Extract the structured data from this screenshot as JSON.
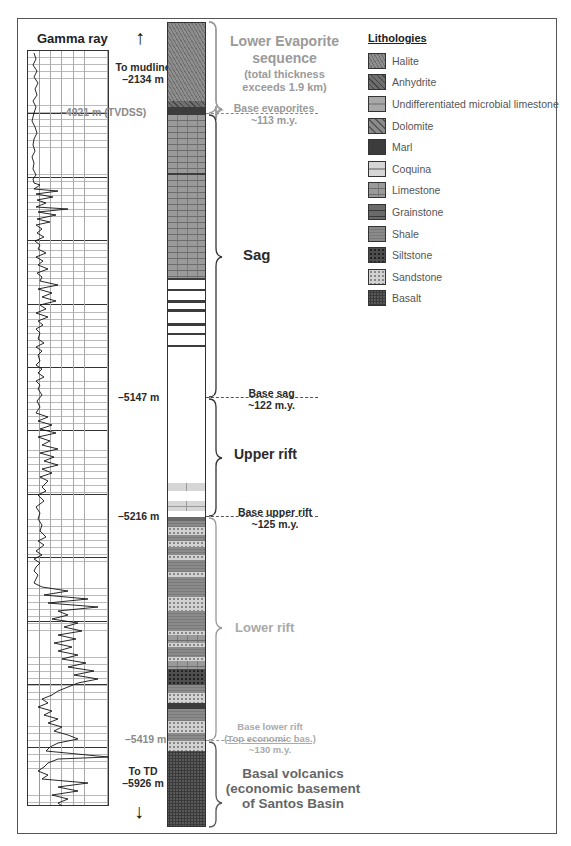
{
  "gamma_ray": {
    "title": "Gamma ray",
    "top_arrow_label_1": "To mudline",
    "top_arrow_label_2": "–2134 m",
    "bottom_arrow_label_1": "To TD",
    "bottom_arrow_label_2": "–5926 m"
  },
  "depth_markers": [
    {
      "label": "–4921 m (TVDSS)",
      "y": 113,
      "color": "#8a8a8a"
    },
    {
      "label": "–5147 m",
      "y": 397,
      "color": "#2a2a2a"
    },
    {
      "label": "–5216 m",
      "y": 516,
      "color": "#2a2a2a"
    },
    {
      "label": "–5419 m",
      "y": 740,
      "color": "#8a8a8a"
    }
  ],
  "intervals": [
    {
      "name": "Lower Evaporite sequence",
      "line1": "Lower Evaporite",
      "line2": "sequence",
      "note1": "(total thickness",
      "note2": "exceeds 1.9 km)",
      "style": "grey"
    },
    {
      "name": "Sag",
      "label": "Sag",
      "style": "dark"
    },
    {
      "name": "Upper rift",
      "label": "Upper rift",
      "style": "dark"
    },
    {
      "name": "Lower rift",
      "label": "Lower rift",
      "style": "grey"
    },
    {
      "name": "Basal volcanics",
      "line1": "Basal volcanics",
      "line2": "(economic basement",
      "line3": "of Santos Basin",
      "style": "mid"
    }
  ],
  "boundaries": [
    {
      "label": "Base evaporites",
      "age": "~113 m.y."
    },
    {
      "label": "Base sag",
      "age": "~122 m.y."
    },
    {
      "label": "Base upper rift",
      "age": "~125 m.y."
    },
    {
      "label": "Base lower rift",
      "sub": "(Top economic bas.)",
      "age": "~130 m.y."
    }
  ],
  "legend": {
    "title": "Lithologies",
    "items": [
      {
        "label": "Halite",
        "pattern": "halite"
      },
      {
        "label": "Anhydrite",
        "pattern": "anhydrite"
      },
      {
        "label": "Undifferentiated microbial limestone",
        "pattern": "microbial"
      },
      {
        "label": "Dolomite",
        "pattern": "dolomite"
      },
      {
        "label": "Marl",
        "pattern": "marl"
      },
      {
        "label": "Coquina",
        "pattern": "coquina"
      },
      {
        "label": "Limestone",
        "pattern": "limestone"
      },
      {
        "label": "Grainstone",
        "pattern": "grainstone"
      },
      {
        "label": "Shale",
        "pattern": "shale"
      },
      {
        "label": "Siltstone",
        "pattern": "siltstone"
      },
      {
        "label": "Sandstone",
        "pattern": "sandstone"
      },
      {
        "label": "Basalt",
        "pattern": "basalt"
      }
    ]
  },
  "column_layers": [
    {
      "top": 0,
      "h": 78,
      "p": "halite"
    },
    {
      "top": 78,
      "h": 6,
      "p": "anhydrite"
    },
    {
      "top": 84,
      "h": 8,
      "p": "marl"
    },
    {
      "top": 92,
      "h": 163,
      "p": "limestone"
    },
    {
      "top": 150,
      "h": 2,
      "p": "marl"
    },
    {
      "top": 255,
      "h": 2,
      "p": "marl"
    },
    {
      "top": 266,
      "h": 2,
      "p": "marl"
    },
    {
      "top": 277,
      "h": 3,
      "p": "marl"
    },
    {
      "top": 286,
      "h": 3,
      "p": "marl"
    },
    {
      "top": 300,
      "h": 3,
      "p": "marl"
    },
    {
      "top": 310,
      "h": 2,
      "p": "marl"
    },
    {
      "top": 322,
      "h": 2,
      "p": "marl"
    },
    {
      "top": 460,
      "h": 8,
      "p": "coquina"
    },
    {
      "top": 478,
      "h": 10,
      "p": "coquina"
    },
    {
      "top": 494,
      "h": 4,
      "p": "grainstone"
    },
    {
      "top": 498,
      "h": 6,
      "p": "shale"
    },
    {
      "top": 504,
      "h": 8,
      "p": "sandstone"
    },
    {
      "top": 512,
      "h": 6,
      "p": "shale"
    },
    {
      "top": 518,
      "h": 6,
      "p": "sandstone"
    },
    {
      "top": 524,
      "h": 8,
      "p": "shale"
    },
    {
      "top": 532,
      "h": 5,
      "p": "sandstone"
    },
    {
      "top": 537,
      "h": 12,
      "p": "shale"
    },
    {
      "top": 549,
      "h": 5,
      "p": "sandstone"
    },
    {
      "top": 554,
      "h": 20,
      "p": "shale"
    },
    {
      "top": 574,
      "h": 14,
      "p": "sandstone"
    },
    {
      "top": 588,
      "h": 20,
      "p": "shale"
    },
    {
      "top": 608,
      "h": 4,
      "p": "sandstone"
    },
    {
      "top": 612,
      "h": 8,
      "p": "limestone"
    },
    {
      "top": 620,
      "h": 4,
      "p": "sandstone"
    },
    {
      "top": 624,
      "h": 10,
      "p": "shale"
    },
    {
      "top": 634,
      "h": 4,
      "p": "sandstone"
    },
    {
      "top": 638,
      "h": 8,
      "p": "limestone"
    },
    {
      "top": 646,
      "h": 16,
      "p": "siltstone"
    },
    {
      "top": 662,
      "h": 8,
      "p": "shale"
    },
    {
      "top": 670,
      "h": 10,
      "p": "sandstone"
    },
    {
      "top": 680,
      "h": 6,
      "p": "marl"
    },
    {
      "top": 686,
      "h": 12,
      "p": "shale"
    },
    {
      "top": 698,
      "h": 12,
      "p": "sandstone"
    },
    {
      "top": 710,
      "h": 8,
      "p": "shale"
    },
    {
      "top": 718,
      "h": 10,
      "p": "sandstone"
    },
    {
      "top": 728,
      "h": 77,
      "p": "basalt"
    }
  ]
}
